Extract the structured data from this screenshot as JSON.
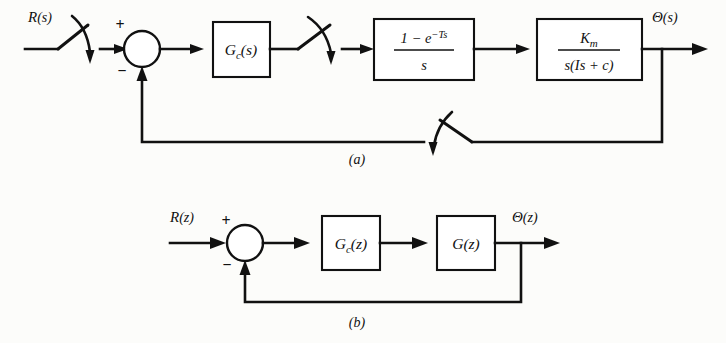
{
  "figure": {
    "type": "control-system-block-diagram",
    "line_color": "#111111",
    "background_color": "#fcfcfa",
    "block_fill": "#ffffff"
  },
  "diagram_a": {
    "caption": "(a)",
    "input_signal": {
      "name": "R",
      "arg": "(s)",
      "full": "R(s)"
    },
    "output_signal": {
      "name": "Θ",
      "arg": "(s)",
      "full": "Θ(s)"
    },
    "summing_junction": {
      "plus_sign": "+",
      "minus_sign": "−"
    },
    "blocks": [
      {
        "id": "controller-s",
        "label_main": "G",
        "label_sub": "c",
        "label_arg": "(s)",
        "full": "G_c(s)"
      },
      {
        "id": "zero-order-hold",
        "numerator_pre": "1 − e",
        "numerator_exp": "−Ts",
        "denominator": "s",
        "full": "(1 − e^{−Ts}) / s"
      },
      {
        "id": "motor-plant",
        "numerator_main": "K",
        "numerator_sub": "m",
        "denominator": "s(Is + c)",
        "full": "K_m / (s(Is + c))"
      }
    ],
    "samplers": [
      {
        "id": "input-sampler",
        "name": "sampler-switch"
      },
      {
        "id": "controller-output-sampler",
        "name": "sampler-switch"
      },
      {
        "id": "feedback-sampler",
        "name": "sampler-switch"
      }
    ]
  },
  "diagram_b": {
    "caption": "(b)",
    "input_signal": {
      "name": "R",
      "arg": "(z)",
      "full": "R(z)"
    },
    "output_signal": {
      "name": "Θ",
      "arg": "(z)",
      "full": "Θ(z)"
    },
    "summing_junction": {
      "plus_sign": "+",
      "minus_sign": "−"
    },
    "blocks": [
      {
        "id": "controller-z",
        "label_main": "G",
        "label_sub": "c",
        "label_arg": "(z)",
        "full": "G_c(z)"
      },
      {
        "id": "plant-z",
        "label_main": "G",
        "label_sub": "",
        "label_arg": "(z)",
        "full": "G(z)"
      }
    ]
  }
}
